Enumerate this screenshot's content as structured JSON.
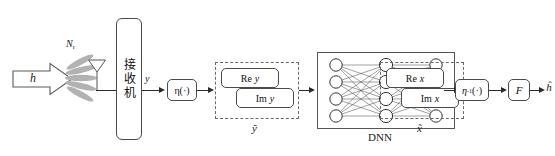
{
  "figure": {
    "background": "#ffffff",
    "line_color": "#2b2b2b",
    "lobe_color": "#b0b0b0"
  },
  "input": {
    "channel_label": "h",
    "antenna_label": "N",
    "antenna_label_sub": "r"
  },
  "receiver": {
    "label": "接收机",
    "output_signal": "y"
  },
  "eta_forward": {
    "label": "η(·)"
  },
  "split_y": {
    "real_prefix": "Re",
    "real_var": "y",
    "imag_prefix": "Im",
    "imag_var": "y",
    "group_label": "ỹ"
  },
  "dnn": {
    "label": "DNN",
    "layers": [
      4,
      4,
      4
    ],
    "layer_names": [
      "input-layer",
      "hidden-layer",
      "output-layer"
    ]
  },
  "split_x": {
    "real_prefix": "Re",
    "real_var": "x",
    "imag_prefix": "Im",
    "imag_var": "x",
    "group_label": "x̃"
  },
  "eta_inverse": {
    "label_base": "η",
    "label_exp": "-1",
    "label_arg": "(·)"
  },
  "transform": {
    "label": "F"
  },
  "output": {
    "estimate_label": "ĥ"
  }
}
